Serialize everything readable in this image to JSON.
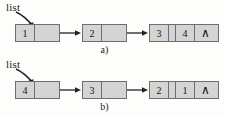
{
  "figure": {
    "background_color": "#fdfdfb",
    "node_fill_color": "#d4d4d4",
    "node_border_color": "#6e6e6e",
    "text_color": "#111111",
    "width": 225,
    "height": 117
  },
  "rows": [
    {
      "id": "a",
      "caption": "a)",
      "pointer_label": "list",
      "pointer_icon": "curved-arrow-icon",
      "nodes": [
        {
          "value": "1",
          "next": "",
          "is_null": false
        },
        {
          "value": "2",
          "next": "",
          "is_null": false
        },
        {
          "value": "3",
          "next": "",
          "is_null": false
        },
        {
          "value": "4",
          "next": "∧",
          "is_null": true
        }
      ]
    },
    {
      "id": "b",
      "caption": "b)",
      "pointer_label": "list",
      "pointer_icon": "curved-arrow-icon",
      "nodes": [
        {
          "value": "4",
          "next": "",
          "is_null": false
        },
        {
          "value": "3",
          "next": "",
          "is_null": false
        },
        {
          "value": "2",
          "next": "",
          "is_null": false
        },
        {
          "value": "1",
          "next": "∧",
          "is_null": true
        }
      ]
    }
  ]
}
